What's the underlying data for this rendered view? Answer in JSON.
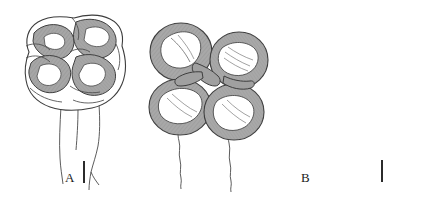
{
  "figure": {
    "type": "scientific-plate",
    "background_color": "#ffffff",
    "panel_count": 3
  },
  "panels": [
    {
      "id": "A",
      "label": "A",
      "kind": "line-drawing",
      "subject": "molar occlusal surface with lophate crescent cusps and bifurcating roots",
      "cusp_count": 4,
      "root_count": 2,
      "outline_color": "#3b3b3b",
      "shading_color": "#9a9a9a",
      "enamel_lake_color": "#ffffff",
      "scalebar": {
        "orientation": "vertical",
        "color": "#2b2b2b"
      }
    },
    {
      "id": "B",
      "label": "B",
      "kind": "line-drawing",
      "subject": "molar occlusal surface with four discrete rounded bunodont cusps and two slender wavy roots",
      "cusp_count": 4,
      "root_count": 2,
      "outline_color": "#3b3b3b",
      "shading_color": "#9a9a9a",
      "enamel_lake_color": "#ffffff",
      "scalebar": {
        "orientation": "vertical",
        "color": "#2b2b2b"
      }
    },
    {
      "id": "C",
      "label": "C",
      "kind": "scanning-electron-micrograph",
      "subject": "tooth crown and root photographed against a dark background",
      "background_color": "#555a5e",
      "specimen_color": "#b9b2a8",
      "scalebar": {
        "orientation": "vertical",
        "color": "#f4f4f4"
      }
    }
  ],
  "labels": {
    "a": "A",
    "b": "B",
    "c": "C"
  }
}
